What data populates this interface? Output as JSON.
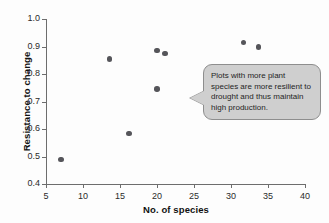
{
  "chart_data": {
    "type": "scatter",
    "title": "",
    "xlabel": "No. of species",
    "ylabel": "Resistance to change",
    "xlim": [
      5,
      40
    ],
    "ylim": [
      0.4,
      1.0
    ],
    "xticks": [
      5,
      10,
      15,
      20,
      25,
      30,
      35,
      40
    ],
    "yticks": [
      "1.0",
      "0.9",
      "0.8",
      "0.7",
      "0.6",
      "0.5",
      "0.4"
    ],
    "ytick_values": [
      1.0,
      0.9,
      0.8,
      0.7,
      0.6,
      0.5,
      0.4
    ],
    "grid": false,
    "legend": null,
    "marker_color": "#55555a",
    "points": [
      {
        "x": 7.0,
        "y": 0.49
      },
      {
        "x": 13.6,
        "y": 0.855
      },
      {
        "x": 16.2,
        "y": 0.583
      },
      {
        "x": 20.0,
        "y": 0.885
      },
      {
        "x": 21.1,
        "y": 0.875
      },
      {
        "x": 20.0,
        "y": 0.745
      },
      {
        "x": 31.7,
        "y": 0.915
      },
      {
        "x": 33.7,
        "y": 0.898
      }
    ],
    "annotations": [
      {
        "text": "Plots with more plant species are more resilient to drought and thus maintain high production.",
        "style": "callout",
        "fill": "#cfcfcf",
        "border": "#8e8e8e",
        "points_to": {
          "x": 22.5,
          "y": 0.705
        }
      }
    ]
  },
  "callout": {
    "text": "Plots with more plant species are more resilient to drought and thus maintain high production."
  }
}
